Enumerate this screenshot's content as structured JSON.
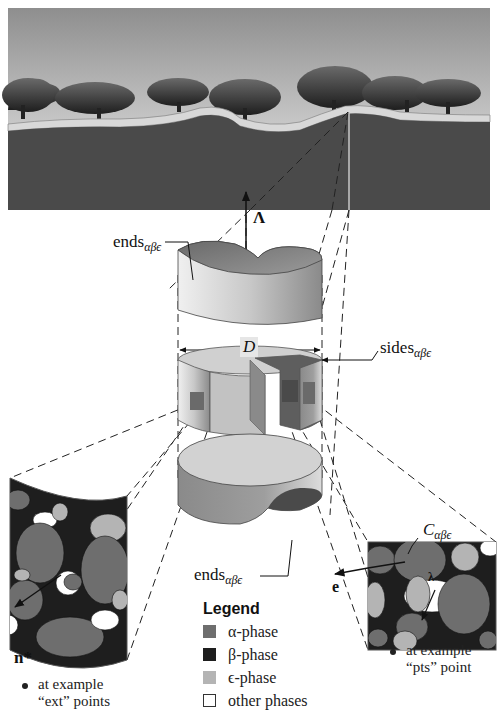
{
  "labels": {
    "lambda_upper": "Λ",
    "ends_top": {
      "base": "ends",
      "sub": "αβϵ"
    },
    "ends_bottom": {
      "base": "ends",
      "sub": "αβϵ"
    },
    "sides": {
      "base": "sides",
      "sub": "αβϵ"
    },
    "D": "D",
    "C": {
      "base": "C",
      "sub": "αβϵ"
    },
    "e": "e",
    "lambda_lower": "λ",
    "n_star": "n*"
  },
  "notes": {
    "left": {
      "line1": "at example",
      "line2": "“ext” points"
    },
    "right": {
      "line1": "at example",
      "line2": "“pts” point"
    }
  },
  "legend": {
    "title": "Legend",
    "items": [
      {
        "label": "α-phase",
        "color": "#6e6e6e"
      },
      {
        "label": "β-phase",
        "color": "#1e1e1e"
      },
      {
        "label": "ϵ-phase",
        "color": "#b4b4b4"
      },
      {
        "label": "other phases",
        "color": "#ffffff"
      }
    ]
  },
  "colors": {
    "sky_top": "#9a9a9a",
    "sky_bottom": "#f0f0f0",
    "ground": "#4a4a4a",
    "alpha": "#6e6e6e",
    "beta": "#1e1e1e",
    "epsilon": "#b4b4b4",
    "other": "#ffffff"
  }
}
